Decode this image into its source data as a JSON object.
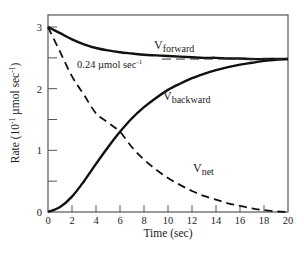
{
  "chart_data": {
    "type": "line",
    "title": "",
    "xlabel": "Time (sec)",
    "ylabel": "Rate (10⁻¹ µmol sec⁻¹)",
    "xlim": [
      0,
      20
    ],
    "ylim": [
      0,
      3
    ],
    "grid": false,
    "x_ticks": [
      0,
      2,
      4,
      6,
      8,
      10,
      12,
      14,
      16,
      18,
      20
    ],
    "y_ticks": [
      0,
      1,
      2,
      3
    ],
    "y_minor_ticks": [
      0.5,
      1.5,
      2.5
    ],
    "x": [
      0,
      1,
      2,
      3,
      4,
      5,
      6,
      7,
      8,
      9,
      10,
      11,
      12,
      13,
      14,
      15,
      16,
      17,
      18,
      19,
      20
    ],
    "series": [
      {
        "name": "V_forward",
        "style": "solid",
        "values": [
          3.0,
          2.9,
          2.8,
          2.72,
          2.66,
          2.62,
          2.59,
          2.57,
          2.55,
          2.54,
          2.53,
          2.52,
          2.51,
          2.5,
          2.5,
          2.49,
          2.49,
          2.48,
          2.48,
          2.48,
          2.48
        ]
      },
      {
        "name": "V_backward",
        "style": "solid",
        "values": [
          0.0,
          0.08,
          0.25,
          0.5,
          0.78,
          1.05,
          1.3,
          1.52,
          1.7,
          1.85,
          1.98,
          2.08,
          2.17,
          2.24,
          2.3,
          2.35,
          2.39,
          2.42,
          2.45,
          2.47,
          2.48
        ]
      },
      {
        "name": "V_net",
        "style": "dashed",
        "values": [
          3.0,
          2.6,
          2.2,
          1.9,
          1.6,
          1.45,
          1.3,
          1.05,
          0.85,
          0.69,
          0.55,
          0.44,
          0.34,
          0.26,
          0.2,
          0.14,
          0.1,
          0.06,
          0.03,
          0.01,
          0.0
        ]
      },
      {
        "name": "equilibrium",
        "style": "dashed",
        "x_range": [
          4.5,
          20
        ],
        "value": 2.48
      }
    ],
    "annotations": [
      {
        "text": "0.24 µmol sec⁻¹",
        "x": 2,
        "y": 2.45
      },
      {
        "text": "V_forward",
        "x": 11.2,
        "y": 2.7
      },
      {
        "text": "V_backward",
        "x": 11.2,
        "y": 1.85
      },
      {
        "text": "V_net",
        "x": 12.0,
        "y": 0.62
      }
    ]
  },
  "labels": {
    "xlabel": "Time (sec)",
    "ylabel_main": "Rate (10",
    "ylabel_exp1": "-1",
    "ylabel_mid": " µmol sec",
    "ylabel_exp2": "-1",
    "ylabel_end": ")",
    "annot_prefix": "0.24 µmol sec",
    "annot_exp": "-1",
    "v_base": "V",
    "forward_sub": "forward",
    "backward_sub": "backward",
    "net_sub": "net"
  },
  "colors": {
    "line": "#111111",
    "axis": "#444444",
    "text": "#222222"
  }
}
